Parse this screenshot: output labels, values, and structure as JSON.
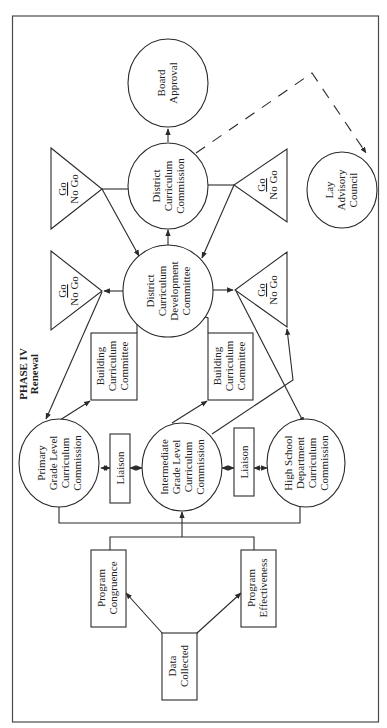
{
  "diagram": {
    "phase_label": "PHASE IV",
    "phase_sublabel": "Renewal",
    "orientation": "rotated 90 degrees counter-clockwise",
    "nodes": {
      "board_approval": {
        "shape": "circle",
        "lines": [
          "Board",
          "Approval"
        ]
      },
      "district_curriculum_commission": {
        "shape": "circle",
        "lines": [
          "District",
          "Curriculum",
          "Commission"
        ]
      },
      "district_curriculum_development_committee": {
        "shape": "circle",
        "lines": [
          "District",
          "Curriculum",
          "Development",
          "Committee"
        ]
      },
      "lay_advisory_council": {
        "shape": "circle",
        "lines": [
          "Lay",
          "Advisory",
          "Council"
        ]
      },
      "primary_grade_commission": {
        "shape": "circle",
        "lines": [
          "Primary",
          "Grade Level",
          "Curriculum",
          "Commission"
        ]
      },
      "intermediate_grade_commission": {
        "shape": "circle",
        "lines": [
          "Intermediate",
          "Grade Level",
          "Curriculum",
          "Commission"
        ]
      },
      "high_school_commission": {
        "shape": "circle",
        "lines": [
          "High School",
          "Department",
          "Curriculum",
          "Commission"
        ]
      },
      "building_committee_left": {
        "shape": "box",
        "lines": [
          "Building",
          "Curriculum",
          "Committee"
        ]
      },
      "building_committee_right": {
        "shape": "box",
        "lines": [
          "Building",
          "Curriculum",
          "Committee"
        ]
      },
      "liaison_left": {
        "shape": "box",
        "lines": [
          "Liaison"
        ]
      },
      "liaison_right": {
        "shape": "box",
        "lines": [
          "Liaison"
        ]
      },
      "program_congruence": {
        "shape": "box",
        "lines": [
          "Program",
          "Congruence"
        ]
      },
      "program_effectiveness": {
        "shape": "box",
        "lines": [
          "Program",
          "Effectiveness"
        ]
      },
      "data_collected": {
        "shape": "box",
        "lines": [
          "Data",
          "Collected"
        ]
      },
      "decision_1": {
        "shape": "triangle",
        "go": "Go",
        "nogo": "No Go"
      },
      "decision_2": {
        "shape": "triangle",
        "go": "Go",
        "nogo": "No Go"
      },
      "decision_3": {
        "shape": "triangle",
        "go": "Go",
        "nogo": "No Go"
      },
      "decision_4": {
        "shape": "triangle",
        "go": "Go",
        "nogo": "No Go"
      }
    },
    "edges": [
      {
        "from": "data_collected",
        "to": "program_congruence",
        "style": "solid-arrow"
      },
      {
        "from": "data_collected",
        "to": "program_effectiveness",
        "style": "solid-arrow"
      },
      {
        "from": "program_congruence",
        "to": "intermediate_grade_commission",
        "style": "solid-arrow"
      },
      {
        "from": "program_effectiveness",
        "to": "intermediate_grade_commission",
        "style": "solid-arrow"
      },
      {
        "from": "primary_grade_commission",
        "to": "liaison_left",
        "style": "bidirectional"
      },
      {
        "from": "liaison_left",
        "to": "intermediate_grade_commission",
        "style": "bidirectional"
      },
      {
        "from": "intermediate_grade_commission",
        "to": "liaison_right",
        "style": "bidirectional"
      },
      {
        "from": "liaison_right",
        "to": "high_school_commission",
        "style": "bidirectional"
      },
      {
        "from": "primary_grade_commission",
        "to": "building_committee_left",
        "style": "solid-arrow"
      },
      {
        "from": "intermediate_grade_commission",
        "to": "building_committee_right",
        "style": "solid-arrow"
      },
      {
        "from": "building_committee_left",
        "to": "district_curriculum_development_committee",
        "style": "solid-arrow"
      },
      {
        "from": "building_committee_right",
        "to": "district_curriculum_development_committee",
        "style": "solid-arrow"
      },
      {
        "from": "district_curriculum_development_committee",
        "to": "decision_2",
        "style": "solid-arrow"
      },
      {
        "from": "district_curriculum_development_committee",
        "to": "decision_4",
        "style": "solid-arrow"
      },
      {
        "from": "decision_2",
        "to": "primary_grade_commission",
        "style": "solid-arrow"
      },
      {
        "from": "decision_4",
        "to": "high_school_commission",
        "style": "solid-arrow"
      },
      {
        "from": "intermediate_grade_commission",
        "to": "decision_4",
        "style": "solid-arrow"
      },
      {
        "from": "district_curriculum_development_committee",
        "to": "district_curriculum_commission",
        "style": "solid-arrow"
      },
      {
        "from": "district_curriculum_commission",
        "to": "decision_1",
        "style": "line"
      },
      {
        "from": "district_curriculum_commission",
        "to": "decision_3",
        "style": "line"
      },
      {
        "from": "decision_1",
        "to": "district_curriculum_development_committee",
        "style": "solid-arrow"
      },
      {
        "from": "decision_3",
        "to": "district_curriculum_development_committee",
        "style": "solid-arrow"
      },
      {
        "from": "district_curriculum_commission",
        "to": "board_approval",
        "style": "solid-arrow"
      },
      {
        "from": "district_curriculum_commission",
        "to": "lay_advisory_council",
        "style": "dashed-arrow"
      }
    ]
  }
}
